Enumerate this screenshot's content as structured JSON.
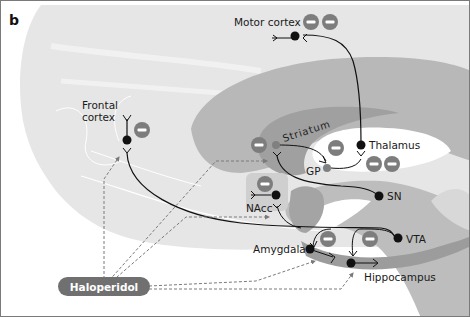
{
  "panel_label": "b",
  "drug": {
    "label": "Haloperidol",
    "color": "#707070"
  },
  "colors": {
    "brain_light": "#e6e6e6",
    "brain_mid": "#b4b4b4",
    "brain_dark": "#9a9a9a",
    "inhibit_badge": "#7d7d7d",
    "neuron": "#111111",
    "dashed_arrow": "#7a7a7a"
  },
  "regions": {
    "motor_cortex": "Motor cortex",
    "frontal_cortex_line1": "Frontal",
    "frontal_cortex_line2": "cortex",
    "striatum": "Striatum",
    "thalamus": "Thalamus",
    "gp": "GP",
    "sn": "SN",
    "nacc": "NAcc",
    "vta": "VTA",
    "amygdala": "Amygdala",
    "hippocampus": "Hippocampus"
  },
  "inhibition_symbol": "−",
  "inhibition_counts": {
    "motor_cortex": 2,
    "frontal_cortex": 1,
    "striatum": 1,
    "gp": 1,
    "thalamus": 2,
    "nacc": 1,
    "amygdala": 1,
    "hippocampus": 1
  },
  "haloperidol_targets": [
    "Frontal cortex",
    "Striatum",
    "NAcc",
    "Amygdala",
    "Hippocampus"
  ]
}
